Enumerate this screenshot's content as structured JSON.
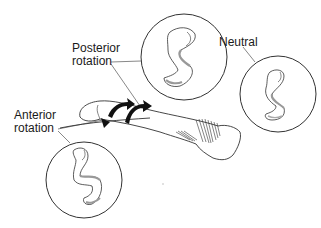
{
  "figure": {
    "labels": {
      "posterior": [
        "Posterior",
        "rotation"
      ],
      "neutral": "Neutral",
      "anterior": [
        "Anterior",
        "rotation"
      ]
    },
    "colors": {
      "line": "#3a3a3a",
      "shade": "#9a9a9a",
      "arrow": "#111111",
      "background": "#ffffff"
    }
  }
}
